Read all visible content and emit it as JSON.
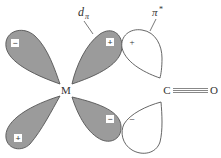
{
  "diagram": {
    "type": "orbital-overlap",
    "colors": {
      "filled_lobe": "#9b9b9b",
      "empty_lobe": "#ffffff",
      "outline": "#555555",
      "text": "#333333"
    },
    "labels": {
      "d_orbital_main": "d",
      "d_orbital_sub": "π",
      "pi_star_main": "π",
      "pi_star_sup": "*",
      "metal": "M",
      "carbon": "C",
      "oxygen": "O"
    },
    "lobes": [
      {
        "name": "d-lobe-top-left",
        "fill": "filled",
        "sign": "−"
      },
      {
        "name": "d-lobe-top-right",
        "fill": "filled",
        "sign": "+"
      },
      {
        "name": "d-lobe-bottom-left",
        "fill": "filled",
        "sign": "+"
      },
      {
        "name": "d-lobe-bottom-right",
        "fill": "filled",
        "sign": "−"
      },
      {
        "name": "pi-star-lobe-top",
        "fill": "empty",
        "sign": "+"
      },
      {
        "name": "pi-star-lobe-bottom",
        "fill": "empty",
        "sign": "−"
      }
    ],
    "bond": {
      "from": "C",
      "to": "O",
      "order": 3
    }
  }
}
